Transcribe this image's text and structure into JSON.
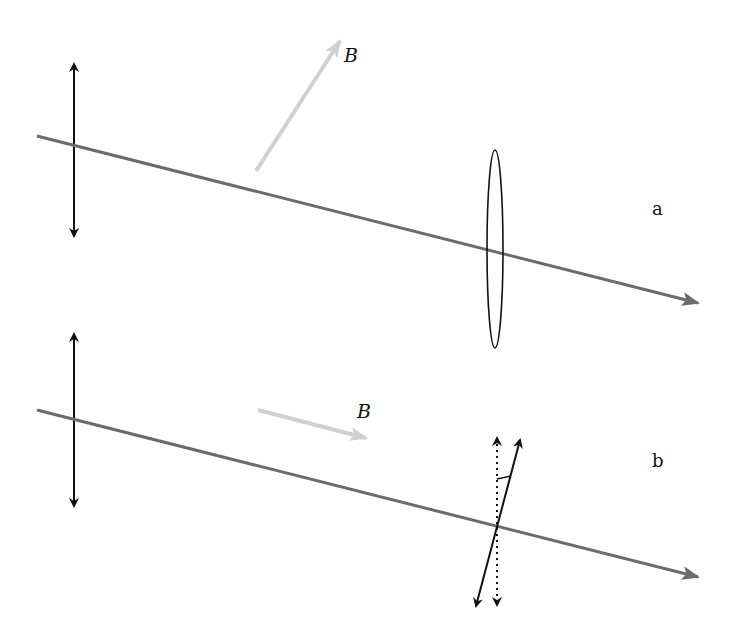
{
  "diagram": {
    "panels": [
      {
        "id": "a",
        "label": "a",
        "field_label": "B",
        "field_orientation": "oblique to propagation",
        "detail": "elliptical polarization"
      },
      {
        "id": "b",
        "label": "b",
        "field_label": "B",
        "field_orientation": "parallel to propagation",
        "detail": "rotated linear polarization"
      }
    ],
    "colors": {
      "beam": "#6b6b6b",
      "field_arrow": "#cfcfcf",
      "polarization": "#111111"
    }
  }
}
